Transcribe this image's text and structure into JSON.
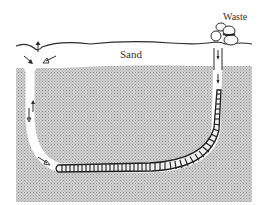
{
  "figure": {
    "type": "diagram",
    "labels": {
      "sand": "Sand",
      "waste": "Waste"
    },
    "elements": [
      {
        "id": "sand-surface",
        "description": "wavy line marking sediment surface"
      },
      {
        "id": "sediment-body",
        "description": "stippled gray sediment below surface"
      },
      {
        "id": "head-shaft",
        "description": "left vertical shaft with feeding funnel, water flow arrows"
      },
      {
        "id": "tail-shaft",
        "description": "right vertical shaft under waste cast mound"
      },
      {
        "id": "worm",
        "description": "segmented worm lying along bottom of U-shaped burrow"
      },
      {
        "id": "waste-casts",
        "description": "coiled fecal casts piled at surface above tail shaft"
      }
    ],
    "colors": {
      "sediment": "#c8c8c8",
      "sediment_dots": "#a8a8a8",
      "burrow": "#ffffff",
      "line": "#2a2a2a",
      "worm_fill": "#f2f2f2"
    }
  }
}
